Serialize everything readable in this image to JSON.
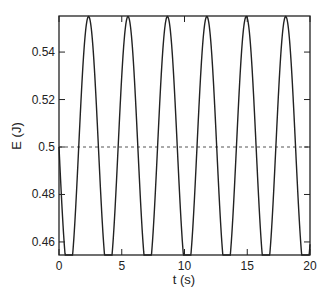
{
  "chart_data": {
    "type": "line",
    "title": "",
    "xlabel": "t (s)",
    "ylabel": "E (J)",
    "xlim": [
      0,
      20
    ],
    "ylim": [
      0.4545,
      0.5552
    ],
    "xticks": [
      0,
      5,
      10,
      15,
      20
    ],
    "xtick_labels": [
      "0",
      "5",
      "10",
      "15",
      "20"
    ],
    "yticks": [
      0.46,
      0.48,
      0.5,
      0.52,
      0.54
    ],
    "ytick_labels": [
      "0.46",
      "0.48",
      "0.5",
      "0.52",
      "0.54"
    ],
    "grid": false,
    "legend": null,
    "series": [
      {
        "name": "E(t)",
        "style": "solid",
        "color": "#222222",
        "formula": "0.5 - 0.055*sin(2t)",
        "x": [
          0,
          0.79,
          2.36,
          3.93,
          5.5,
          7.07,
          8.64,
          10.21,
          11.78,
          13.35,
          14.92,
          16.49,
          18.06,
          19.63,
          20
        ],
        "values": [
          0.5,
          0.455,
          0.555,
          0.455,
          0.555,
          0.455,
          0.555,
          0.455,
          0.555,
          0.455,
          0.555,
          0.455,
          0.555,
          0.455,
          0.467
        ]
      },
      {
        "name": "mean",
        "style": "dotted",
        "color": "#555555",
        "x": [
          0,
          20
        ],
        "values": [
          0.5,
          0.5
        ]
      }
    ]
  }
}
